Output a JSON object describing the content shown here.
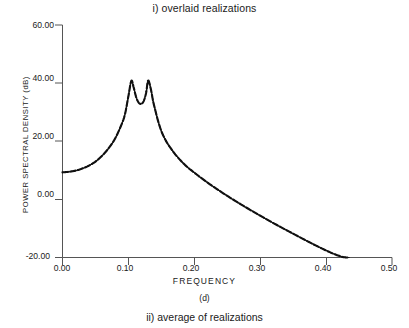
{
  "figure": {
    "title_top": "i) overlaid realizations",
    "title_bottom": "ii) average of realizations",
    "panel_label": "(d)",
    "xlabel": "FREQUENCY",
    "ylabel": "POWER SPECTRAL DENSITY (dB)"
  },
  "chart_data": {
    "type": "line",
    "title": "i) overlaid realizations",
    "subtitle": "ii) average of realizations",
    "annotations": [
      "(d)"
    ],
    "xlabel": "FREQUENCY",
    "ylabel": "POWER SPECTRAL DENSITY (dB)",
    "xlim": [
      0.0,
      0.5
    ],
    "ylim": [
      -20.0,
      60.0
    ],
    "grid": false,
    "legend": "none",
    "line_color": "#111111",
    "line_style": "dashed-overlaid",
    "xticks": [
      0.0,
      0.1,
      0.2,
      0.3,
      0.4,
      0.5
    ],
    "xtick_labels": [
      "0.00",
      "0.10",
      "0.20",
      "0.30",
      "0.40",
      "0.50"
    ],
    "yticks": [
      -20.0,
      0.0,
      20.0,
      40.0,
      60.0
    ],
    "ytick_labels": [
      "-20.00",
      "0.00",
      "20.00",
      "40.00",
      "60.00"
    ],
    "series": [
      {
        "name": "overlaid realizations (PSD estimate)",
        "x": [
          0.0,
          0.01,
          0.02,
          0.03,
          0.04,
          0.05,
          0.06,
          0.07,
          0.08,
          0.09,
          0.095,
          0.1,
          0.1045,
          0.108,
          0.112,
          0.116,
          0.12,
          0.1235,
          0.127,
          0.13,
          0.134,
          0.1375,
          0.141,
          0.145,
          0.15,
          0.155,
          0.16,
          0.17,
          0.18,
          0.19,
          0.2,
          0.215,
          0.23,
          0.25,
          0.27,
          0.29,
          0.31,
          0.33,
          0.35,
          0.37,
          0.39,
          0.41,
          0.425,
          0.435
        ],
        "y": [
          9.3,
          9.5,
          9.9,
          10.6,
          11.6,
          13.0,
          15.0,
          17.6,
          21.0,
          26.0,
          29.5,
          35.5,
          40.8,
          38.5,
          35.0,
          33.2,
          32.9,
          34.0,
          36.8,
          40.9,
          38.0,
          33.8,
          30.5,
          27.0,
          23.5,
          21.0,
          19.0,
          15.8,
          13.2,
          11.0,
          9.2,
          6.6,
          4.2,
          1.2,
          -1.6,
          -4.3,
          -6.9,
          -9.4,
          -11.8,
          -14.2,
          -16.5,
          -18.6,
          -19.8,
          -20.0
        ]
      }
    ],
    "peaks": [
      {
        "frequency": 0.105,
        "psd_db": 41.0
      },
      {
        "frequency": 0.136,
        "psd_db": 41.0
      }
    ],
    "valley": {
      "frequency": 0.121,
      "psd_db": 32.8
    },
    "start_point": {
      "frequency": 0.0,
      "psd_db": 9.3
    }
  }
}
